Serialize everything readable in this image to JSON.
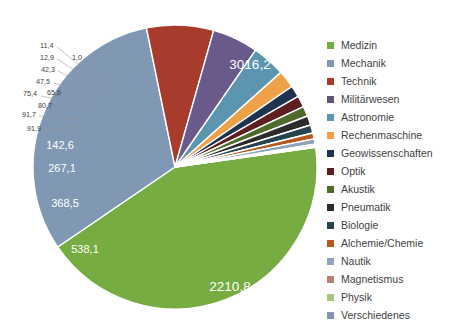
{
  "chart_data": {
    "type": "pie",
    "title": "",
    "subtitle": "",
    "xlabel": "",
    "ylabel": "",
    "legend_position": "right",
    "grid": false,
    "value_decimal_separator": ",",
    "total": 7063.2,
    "categories": [
      "Medizin",
      "Mechanik",
      "Technik",
      "Militärwesen",
      "Astronomie",
      "Rechenmaschine",
      "Geowissenschaften",
      "Optik",
      "Akustik",
      "Pneumatik",
      "Biologie",
      "Alchemie/Chemie",
      "Nautik",
      "Magnetismus",
      "Physik",
      "Verschiedenes"
    ],
    "values": [
      3016.2,
      2210.8,
      538.1,
      368.5,
      267.1,
      142.6,
      91.9,
      91.7,
      80.7,
      75.4,
      65.6,
      47.5,
      42.3,
      12.9,
      11.4,
      1.0
    ],
    "value_labels": [
      "3016,2",
      "2210,8",
      "538,1",
      "368,5",
      "267,1",
      "142,6",
      "91,9",
      "91,7",
      "80,7",
      "75,4",
      "65,6",
      "47,5",
      "42,3",
      "12,9",
      "11,4",
      "1,0"
    ],
    "colors": [
      "#77ac42",
      "#8198b4",
      "#a83c2c",
      "#6a5a8c",
      "#5b95b0",
      "#eda martinez",
      "#1f3350",
      "#5d1f1f",
      "#4e6b2c",
      "#2b2b2b",
      "#24434f",
      "#b5581f",
      "#8fa2bc",
      "#b98076",
      "#a9c47f",
      "#8394b0"
    ]
  },
  "legend": {
    "items": [
      {
        "label": "Medizin",
        "color": "#77ac42"
      },
      {
        "label": "Mechanik",
        "color": "#8198b4"
      },
      {
        "label": "Technik",
        "color": "#a83c2c"
      },
      {
        "label": "Militärwesen",
        "color": "#5f5572"
      },
      {
        "label": "Astronomie",
        "color": "#5b95b0"
      },
      {
        "label": "Rechenmaschine",
        "color": "#efa martinez"
      },
      {
        "label": "Geowissenschaften",
        "color": "#1f3350"
      },
      {
        "label": "Optik",
        "color": "#5d1f1f"
      },
      {
        "label": "Akustik",
        "color": "#4e6b2c"
      },
      {
        "label": "Pneumatik",
        "color": "#2b2b2b"
      },
      {
        "label": "Biologie",
        "color": "#24434f"
      },
      {
        "label": "Alchemie/Chemie",
        "color": "#b5581f"
      },
      {
        "label": "Nautik",
        "color": "#8fa2bc"
      },
      {
        "label": "Magnetismus",
        "color": "#b98076"
      },
      {
        "label": "Physik",
        "color": "#a9c47f"
      },
      {
        "label": "Verschiedenes",
        "color": "#8394b0"
      }
    ]
  },
  "pie_geometry": {
    "cx": 175,
    "cy": 167,
    "r": 142,
    "start_angle_deg": -8,
    "direction": "clockwise",
    "slice_gap_deg": 0.9
  },
  "inner_labels": [
    {
      "text": "3016,2",
      "x": 250,
      "y": 69,
      "size": "big"
    },
    {
      "text": "2210,8",
      "x": 230,
      "y": 291,
      "size": "big"
    },
    {
      "text": "538,1",
      "x": 85,
      "y": 253,
      "size": "mid"
    },
    {
      "text": "368,5",
      "x": 65,
      "y": 207,
      "size": "mid"
    },
    {
      "text": "267,1",
      "x": 62,
      "y": 172,
      "size": "mid"
    },
    {
      "text": "142,6",
      "x": 60,
      "y": 149,
      "size": "mid"
    }
  ],
  "outer_labels": [
    {
      "text": "11,4",
      "tx": 40,
      "ty": 48,
      "lx1": 57,
      "ly1": 47,
      "lx2": 104,
      "ly2": 85
    },
    {
      "text": "12,9",
      "tx": 40,
      "ty": 60,
      "lx1": 57,
      "ly1": 59,
      "lx2": 103,
      "ly2": 88
    },
    {
      "text": "1,0",
      "tx": 72,
      "ty": 60,
      "lx1": 82,
      "ly1": 62,
      "lx2": 106,
      "ly2": 84
    },
    {
      "text": "42,3",
      "tx": 41,
      "ty": 72,
      "lx1": 58,
      "ly1": 71,
      "lx2": 100,
      "ly2": 92
    },
    {
      "text": "47,5",
      "tx": 36,
      "ty": 84,
      "lx1": 54,
      "ly1": 83,
      "lx2": 96,
      "ly2": 97
    },
    {
      "text": "65,6",
      "tx": 47,
      "ty": 95,
      "lx1": 64,
      "ly1": 94,
      "lx2": 93,
      "ly2": 103
    },
    {
      "text": "75,4",
      "tx": 23,
      "ty": 96,
      "lx1": 41,
      "ly1": 96,
      "lx2": 89,
      "ly2": 106
    },
    {
      "text": "80,7",
      "tx": 38,
      "ty": 108,
      "lx1": 55,
      "ly1": 107,
      "lx2": 86,
      "ly2": 112
    },
    {
      "text": "91,7",
      "tx": 22,
      "ty": 117,
      "lx1": 39,
      "ly1": 116,
      "lx2": 82,
      "ly2": 119
    },
    {
      "text": "91,9",
      "tx": 27,
      "ty": 131,
      "lx1": 45,
      "ly1": 130,
      "lx2": 78,
      "ly2": 127
    }
  ]
}
